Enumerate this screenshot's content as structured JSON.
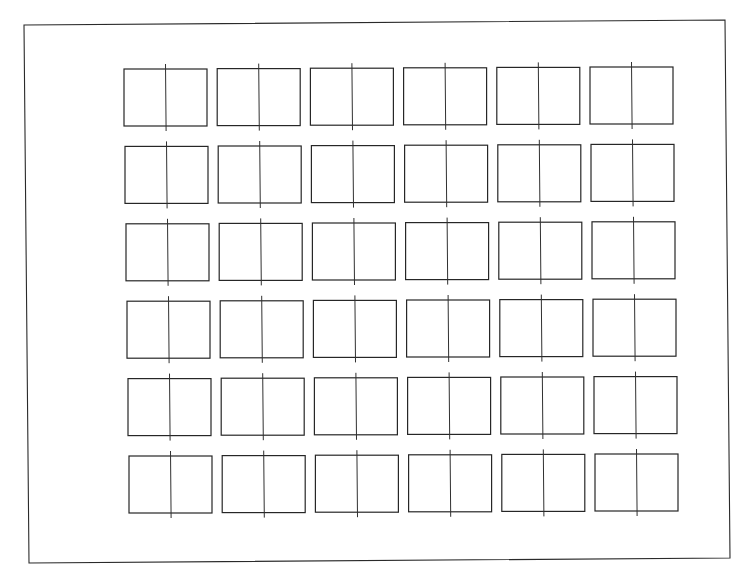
{
  "diagram": {
    "type": "grid-of-split-rectangles",
    "rows": 6,
    "cols": 6,
    "colors": {
      "line": "#2a2a2a",
      "background": "#ffffff"
    },
    "frame": {
      "tl": [
        24,
        25
      ],
      "tr": [
        725,
        20
      ],
      "br": [
        730,
        558
      ],
      "bl": [
        29,
        563
      ]
    },
    "cell": {
      "width": 83,
      "height": 57,
      "divider_overhang": 5
    },
    "grid_origin": [
      124,
      69
    ],
    "pitch": {
      "col": [
        93.2,
        -0.4
      ],
      "row": [
        1.0,
        77.4
      ]
    }
  }
}
